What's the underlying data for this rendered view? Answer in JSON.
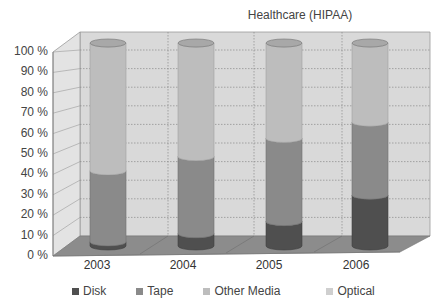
{
  "chart_data": {
    "type": "bar",
    "stacked": true,
    "percent_stacked": true,
    "style": "3d-cylinder",
    "title": "Healthcare (HIPAA)",
    "xlabel": "",
    "ylabel": "",
    "ylim": [
      0,
      100
    ],
    "yticks": [
      "0 %",
      "10 %",
      "20 %",
      "30 %",
      "40 %",
      "50 %",
      "60 %",
      "70 %",
      "80 %",
      "90 %",
      "100 %"
    ],
    "categories": [
      "2003",
      "2004",
      "2005",
      "2006"
    ],
    "series": [
      {
        "name": "Disk",
        "values": [
          2,
          6,
          12,
          25
        ],
        "color": "#5a5a5a"
      },
      {
        "name": "Tape",
        "values": [
          35,
          38,
          41,
          36
        ],
        "color": "#8a8a8a"
      },
      {
        "name": "Other Media",
        "values": [
          63,
          56,
          47,
          39
        ],
        "color": "#bdbdbd"
      },
      {
        "name": "Optical",
        "values": [
          0,
          0,
          0,
          0
        ],
        "color": "#d0d0d0"
      }
    ],
    "grid": true,
    "legend_position": "bottom"
  },
  "legend": [
    {
      "label": "Disk",
      "color": "#4f4f4f"
    },
    {
      "label": "Tape",
      "color": "#8a8a8a"
    },
    {
      "label": "Other Media",
      "color": "#bdbdbd"
    },
    {
      "label": "Optical",
      "color": "#cfcfcf"
    }
  ]
}
